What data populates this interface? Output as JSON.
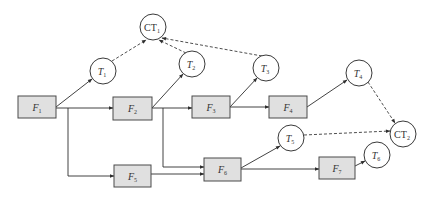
{
  "diagram": {
    "type": "flow-task-graph",
    "functions": [
      {
        "id": "F1",
        "base": "F",
        "sub": "1",
        "x": 18,
        "y": 96,
        "w": 38,
        "h": 22
      },
      {
        "id": "F2",
        "base": "F",
        "sub": "2",
        "x": 113,
        "y": 97,
        "w": 39,
        "h": 23
      },
      {
        "id": "F3",
        "base": "F",
        "sub": "3",
        "x": 192,
        "y": 96,
        "w": 38,
        "h": 22
      },
      {
        "id": "F4",
        "base": "F",
        "sub": "4",
        "x": 269,
        "y": 96,
        "w": 38,
        "h": 22
      },
      {
        "id": "F5",
        "base": "F",
        "sub": "5",
        "x": 114,
        "y": 165,
        "w": 37,
        "h": 22
      },
      {
        "id": "F6",
        "base": "F",
        "sub": "6",
        "x": 204,
        "y": 158,
        "w": 37,
        "h": 23
      },
      {
        "id": "F7",
        "base": "F",
        "sub": "7",
        "x": 319,
        "y": 157,
        "w": 36,
        "h": 22
      }
    ],
    "tasks": [
      {
        "id": "CT1",
        "base": "CT",
        "sub": "1",
        "cx": 153,
        "cy": 27,
        "r": 13,
        "italic": false
      },
      {
        "id": "T1",
        "base": "T",
        "sub": "1",
        "cx": 103,
        "cy": 71,
        "r": 13,
        "italic": true
      },
      {
        "id": "T2",
        "base": "T",
        "sub": "2",
        "cx": 192,
        "cy": 64,
        "r": 13,
        "italic": true
      },
      {
        "id": "T3",
        "base": "T",
        "sub": "3",
        "cx": 266,
        "cy": 68,
        "r": 13,
        "italic": true
      },
      {
        "id": "T4",
        "base": "T",
        "sub": "4",
        "cx": 359,
        "cy": 73,
        "r": 13,
        "italic": true
      },
      {
        "id": "CT2",
        "base": "CT",
        "sub": "2",
        "cx": 403,
        "cy": 134,
        "r": 13,
        "italic": false
      },
      {
        "id": "T5",
        "base": "T",
        "sub": "5",
        "cx": 291,
        "cy": 138,
        "r": 13,
        "italic": true
      },
      {
        "id": "T6",
        "base": "T",
        "sub": "6",
        "cx": 377,
        "cy": 155,
        "r": 13,
        "italic": true
      }
    ],
    "solid_edges": [
      {
        "from": "F1",
        "to": "T1",
        "path": "M56,107 L92,79"
      },
      {
        "from": "F1",
        "to": "F2",
        "path": "M56,108 L113,108"
      },
      {
        "from": "F1",
        "to": "F5",
        "path": "M68,108 L68,176 L114,176"
      },
      {
        "from": "F2",
        "to": "T2",
        "path": "M152,108 L183,74"
      },
      {
        "from": "F2",
        "to": "F3",
        "path": "M152,108 L192,108"
      },
      {
        "from": "F2",
        "to": "F6",
        "path": "M163,108 L163,167 L204,167"
      },
      {
        "from": "F3",
        "to": "T3",
        "path": "M230,107 L257,78"
      },
      {
        "from": "F3",
        "to": "F4",
        "path": "M230,107 L269,107"
      },
      {
        "from": "F4",
        "to": "T4",
        "path": "M307,107 L347,80"
      },
      {
        "from": "F5",
        "to": "F6",
        "path": "M151,174 L204,174"
      },
      {
        "from": "F6",
        "to": "T5",
        "path": "M241,168 L280,146"
      },
      {
        "from": "F6",
        "to": "F7",
        "path": "M241,169 L319,169"
      },
      {
        "from": "F7",
        "to": "T6",
        "path": "M355,166 L365,161"
      }
    ],
    "dashed_edges": [
      {
        "from": "T1",
        "to": "CT1",
        "path": "M112,61 L146,40"
      },
      {
        "from": "T2",
        "to": "CT1",
        "path": "M186,53 L159,40"
      },
      {
        "from": "T3",
        "to": "CT1",
        "path": "M262,56 L162,38"
      },
      {
        "from": "T4",
        "to": "CT2",
        "path": "M368,82 L395,123"
      },
      {
        "from": "T5",
        "to": "CT2",
        "path": "M304,135 L390,131"
      }
    ]
  }
}
